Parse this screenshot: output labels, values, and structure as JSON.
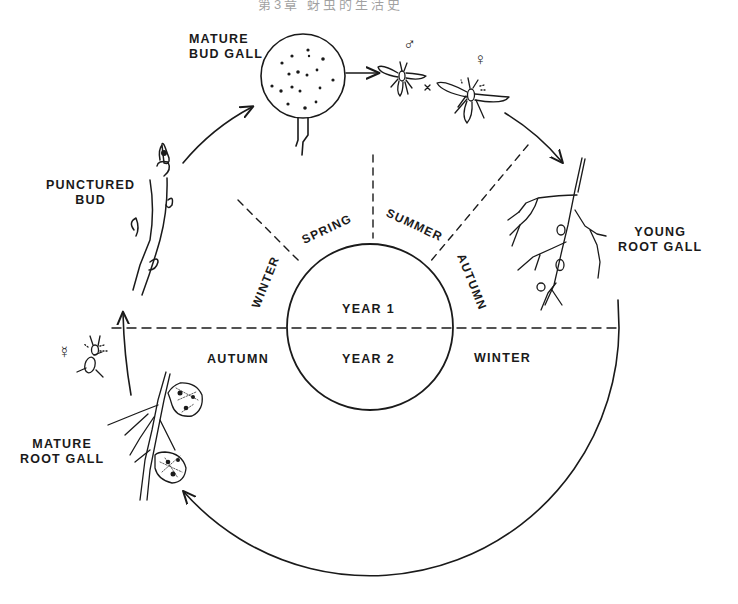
{
  "header": {
    "text": "第3章  蚜虫的生活史"
  },
  "diagram": {
    "center_circle": {
      "year1": "YEAR 1",
      "year2": "YEAR 2"
    },
    "seasons_year1": [
      "WINTER",
      "SPRING",
      "SUMMER",
      "AUTUMN"
    ],
    "seasons_year2": {
      "left": "AUTUMN",
      "right": "WINTER"
    },
    "stages": {
      "mature_bud_gall": {
        "line1": "MATURE",
        "line2": "BUD GALL"
      },
      "punctured_bud": {
        "line1": "PUNCTURED",
        "line2": "BUD"
      },
      "young_root_gall": {
        "line1": "YOUNG",
        "line2": "ROOT GALL"
      },
      "mature_root_gall": {
        "line1": "MATURE",
        "line2": "ROOT GALL"
      }
    },
    "symbols": {
      "male": "♂",
      "female": "♀",
      "agamic": "☿",
      "cross": "×"
    },
    "colors": {
      "ink": "#1a1a1a",
      "background": "#ffffff"
    }
  }
}
